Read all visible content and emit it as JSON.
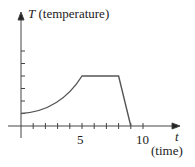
{
  "chart_data": {
    "type": "line",
    "title": "",
    "xlabel": "(time)",
    "xvar": "t",
    "ylabel": "(temperature)",
    "yvar": "T",
    "x": [
      0,
      1,
      2,
      3,
      4,
      5,
      8,
      9
    ],
    "values": [
      1,
      1.1,
      1.4,
      1.9,
      2.7,
      4,
      4,
      0
    ],
    "segments": [
      {
        "kind": "curve",
        "from": [
          0,
          1
        ],
        "to": [
          5,
          4
        ],
        "shape": "increasing concave-up"
      },
      {
        "kind": "line",
        "from": [
          5,
          4
        ],
        "to": [
          8,
          4
        ]
      },
      {
        "kind": "line",
        "from": [
          8,
          4
        ],
        "to": [
          9,
          0
        ]
      }
    ],
    "x_tick_labels": [
      "5",
      "10"
    ],
    "x_ticks": [
      1,
      2,
      3,
      4,
      5,
      6,
      7,
      8,
      9,
      10
    ],
    "y_ticks": [
      1,
      2,
      3,
      4,
      5,
      6
    ],
    "xlim": [
      0,
      11
    ],
    "ylim": [
      0,
      7
    ],
    "grid": false,
    "legend": null
  },
  "labels": {
    "y_var": "T",
    "y_name": "(temperature)",
    "x_var": "t",
    "x_name": "(time)",
    "tick5": "5",
    "tick10": "10"
  }
}
